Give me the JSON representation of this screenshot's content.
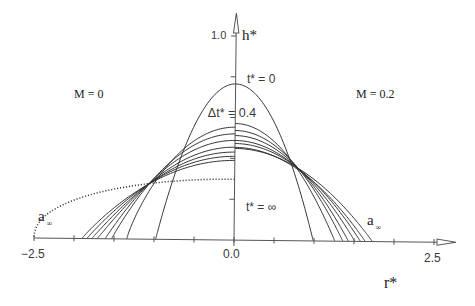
{
  "chart_data": {
    "type": "line",
    "title": "",
    "xlabel": "r*",
    "ylabel": "h*",
    "xlim": [
      -2.5,
      2.5
    ],
    "ylim": [
      0,
      1.0
    ],
    "grid": false,
    "legend": null,
    "x_ticks": [
      -2.5,
      -2.0,
      -1.5,
      -1.0,
      -0.5,
      0.0,
      0.5,
      1.0,
      1.5,
      2.0,
      2.5
    ],
    "x_tick_labels": [
      {
        "value": -2.5,
        "label": "−2.5"
      },
      {
        "value": 0.0,
        "label": "0.0"
      },
      {
        "value": 2.5,
        "label": "2.5"
      }
    ],
    "y_ticks": [
      0.2,
      0.4,
      0.6,
      0.8,
      1.0
    ],
    "y_tick_labels": [
      {
        "value": 1.0,
        "label": "1.0"
      }
    ],
    "profile_model": "h* = h0 * (1 - (r*/R)^2)^p  (h0 = height at r*=0, R = front position)",
    "time_step_label": "Δt* = 0.4",
    "panels": [
      {
        "side": "left",
        "label": "M = 0",
        "series": [
          {
            "name": "t* = 0",
            "h0": 0.765,
            "R": 0.98,
            "p": 1.0,
            "style": "solid"
          },
          {
            "name": "t* = 0.4",
            "h0": 0.553,
            "R": 1.34,
            "p": 0.85,
            "style": "solid"
          },
          {
            "name": "t* = 0.8",
            "h0": 0.52,
            "R": 1.53,
            "p": 0.98,
            "style": "solid"
          },
          {
            "name": "t* = 1.2",
            "h0": 0.488,
            "R": 1.61,
            "p": 1.0,
            "style": "solid"
          },
          {
            "name": "t* = 1.6",
            "h0": 0.455,
            "R": 1.71,
            "p": 1.04,
            "style": "solid"
          },
          {
            "name": "t* = 2.0",
            "h0": 0.431,
            "R": 1.78,
            "p": 1.04,
            "style": "solid"
          },
          {
            "name": "t* = 2.4",
            "h0": 0.41,
            "R": 1.84,
            "p": 1.0,
            "style": "solid"
          },
          {
            "name": "t* = 2.8",
            "h0": 0.39,
            "R": 1.9,
            "p": 0.96,
            "style": "solid"
          },
          {
            "name": "t* = ∞ (a∞)",
            "h0": 0.298,
            "R": 2.5,
            "p": 0.45,
            "style": "dotted"
          }
        ]
      },
      {
        "side": "right",
        "label": "M = 0.2",
        "series": [
          {
            "name": "t* = 0",
            "h0": 0.765,
            "R": 0.99,
            "p": 1.0,
            "style": "solid"
          },
          {
            "name": "t* = 0.4",
            "h0": 0.571,
            "R": 1.26,
            "p": 1.0,
            "style": "solid"
          },
          {
            "name": "t* = 0.8",
            "h0": 0.537,
            "R": 1.36,
            "p": 1.0,
            "style": "solid"
          },
          {
            "name": "t* = 1.2",
            "h0": 0.512,
            "R": 1.43,
            "p": 1.0,
            "style": "solid"
          },
          {
            "name": "t* = 1.6",
            "h0": 0.488,
            "R": 1.51,
            "p": 1.0,
            "style": "solid"
          },
          {
            "name": "t* = 2.0",
            "h0": 0.473,
            "R": 1.58,
            "p": 1.0,
            "style": "solid"
          },
          {
            "name": "t* = 2.4",
            "h0": 0.454,
            "R": 1.64,
            "p": 1.0,
            "style": "solid"
          },
          {
            "name": "t* = ∞ (a∞)",
            "h0": 0.449,
            "R": 1.73,
            "p": 1.0,
            "style": "solid"
          }
        ]
      }
    ],
    "annotations": {
      "t0": "t* = 0",
      "dt": "Δt* = 0.4",
      "tinf": "t* = ∞",
      "left_panel": "M = 0",
      "right_panel": "M = 0.2",
      "a_inf_left": {
        "base": "a",
        "sub": "∞"
      },
      "a_inf_right": {
        "base": "a",
        "sub": "∞"
      }
    }
  }
}
